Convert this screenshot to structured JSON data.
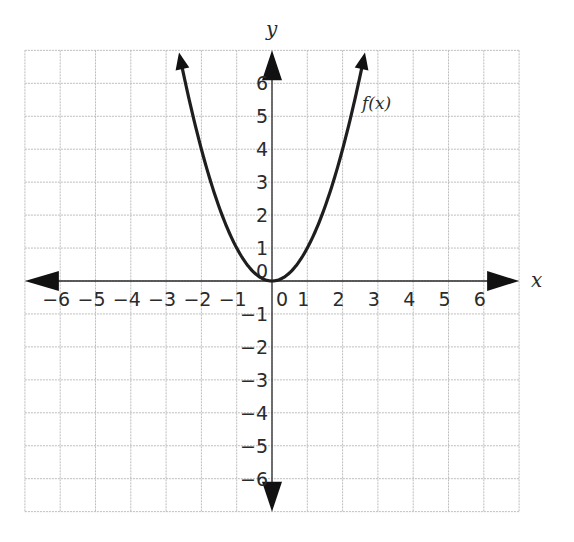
{
  "chart_data": {
    "type": "line",
    "title": "",
    "xlabel": "x",
    "ylabel": "y",
    "xlim": [
      -7,
      7
    ],
    "ylim": [
      -7,
      7
    ],
    "grid": true,
    "x_ticks": [
      -6,
      -5,
      -4,
      -3,
      -2,
      -1,
      0,
      1,
      2,
      3,
      4,
      5,
      6
    ],
    "x_tick_labels": [
      "−6",
      "−5",
      "−4",
      "−3",
      "−2",
      "−1",
      "0",
      "1",
      "2",
      "3",
      "4",
      "5",
      "6"
    ],
    "y_ticks": [
      -6,
      -5,
      -4,
      -3,
      -2,
      -1,
      1,
      2,
      3,
      4,
      5,
      6
    ],
    "y_tick_labels": [
      "−6",
      "−5",
      "−4",
      "−3",
      "−2",
      "−1",
      "1",
      "2",
      "3",
      "4",
      "5",
      "6"
    ],
    "y_zero_label": "0",
    "series": [
      {
        "name": "f(x)",
        "expression": "x^2",
        "x": [
          -2.6,
          -2,
          -1.5,
          -1,
          -0.5,
          0,
          0.5,
          1,
          1.5,
          2,
          2.6
        ],
        "y": [
          6.76,
          4,
          2.25,
          1,
          0.25,
          0,
          0.25,
          1,
          2.25,
          4,
          6.76
        ],
        "arrows_at_ends": true,
        "label_position": [
          2.6,
          5.3
        ]
      }
    ],
    "legend": null
  },
  "axes": {
    "x_name": "x",
    "y_name": "y"
  },
  "curve_label": "f(x)",
  "colors": {
    "grid": "#bdbdbd",
    "axes": "#2a2a2a",
    "curve": "#1e1e1e",
    "text": "#2b2b2b"
  }
}
